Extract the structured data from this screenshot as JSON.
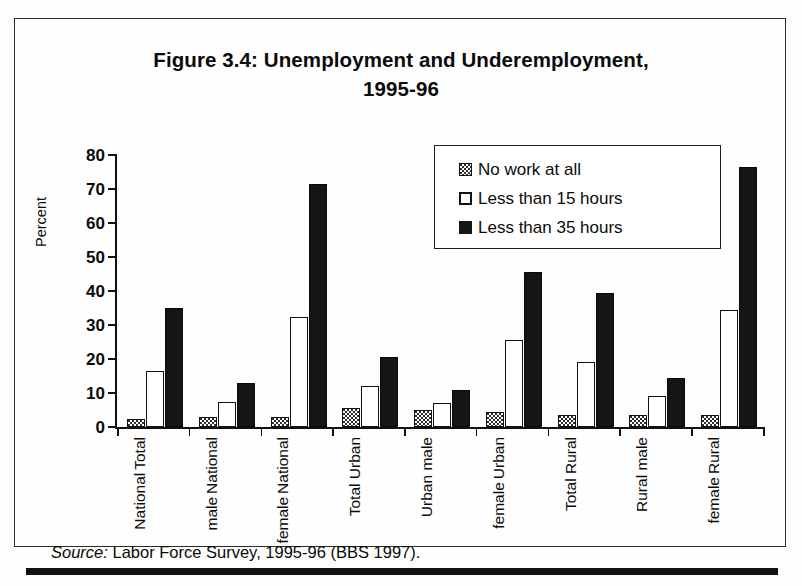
{
  "figure": {
    "title_line1": "Figure 3.4: Unemployment and Underemployment,",
    "title_line2": "1995-96",
    "source_lead": "Source:",
    "source_text": " Labor Force Survey, 1995-96 (BBS 1997)."
  },
  "chart_data": {
    "type": "bar",
    "title": "Figure 3.4: Unemployment and Underemployment, 1995-96",
    "xlabel": "",
    "ylabel": "Percent",
    "ylim": [
      0,
      80
    ],
    "yticks": [
      0,
      10,
      20,
      30,
      40,
      50,
      60,
      70,
      80
    ],
    "grid": false,
    "legend_position": "upper-center-right",
    "categories": [
      "Total National",
      "National male",
      "National female",
      "Total Urban",
      "Urban male",
      "Urban female",
      "Total Rural",
      "Rural male",
      "Rural female"
    ],
    "category_lines": [
      [
        "Total",
        "National"
      ],
      [
        "National",
        "male"
      ],
      [
        "National",
        "female"
      ],
      [
        "Total Urban"
      ],
      [
        "Urban male"
      ],
      [
        "Urban",
        "female"
      ],
      [
        "Total Rural"
      ],
      [
        "Rural male"
      ],
      [
        "Rural",
        "female"
      ]
    ],
    "series": [
      {
        "name": "No work at all",
        "fill": "dark-checkered",
        "color": "#2e2e2e",
        "values": [
          2.5,
          3.0,
          3.0,
          5.5,
          5.0,
          4.5,
          3.5,
          3.5,
          3.5
        ]
      },
      {
        "name": "Less than 15 hours",
        "fill": "white-outlined",
        "color": "#ffffff",
        "values": [
          16.5,
          7.5,
          32.5,
          12.0,
          7.0,
          25.5,
          19.0,
          9.0,
          34.5
        ]
      },
      {
        "name": "Less than 35 hours",
        "fill": "solid-black",
        "color": "#151515",
        "values": [
          35.0,
          13.0,
          71.5,
          20.5,
          11.0,
          45.5,
          39.5,
          14.5,
          76.5
        ]
      }
    ]
  }
}
